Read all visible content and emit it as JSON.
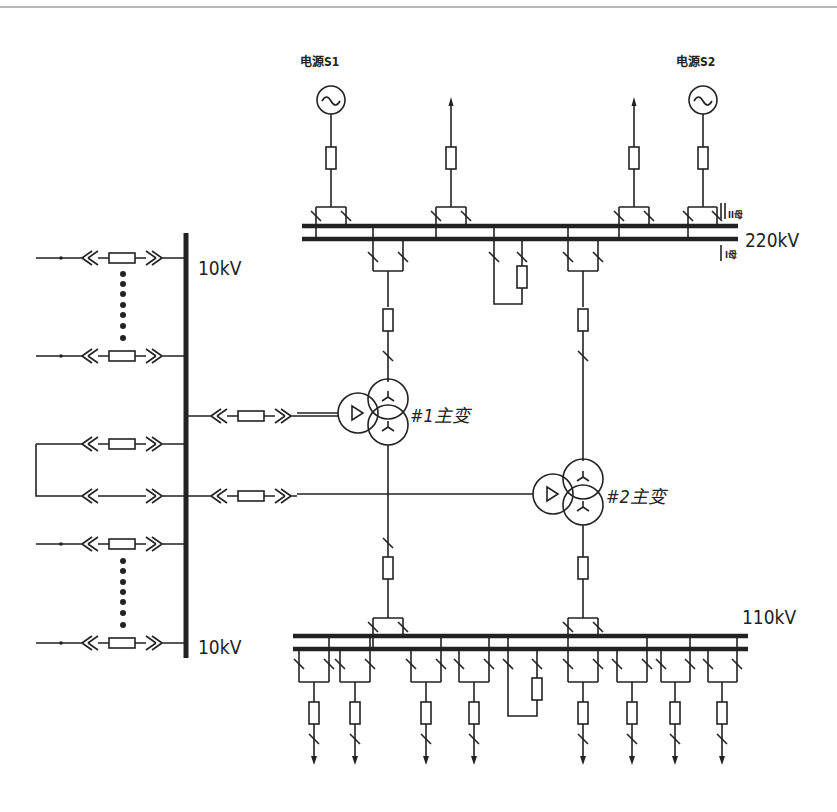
{
  "diagram": {
    "sources": [
      {
        "id": "S1",
        "label": "电源S1"
      },
      {
        "id": "S2",
        "label": "电源S2"
      }
    ],
    "buses": {
      "hv": {
        "voltage": "220kV",
        "bus_ii_label": "II母",
        "bus_i_label": "I母"
      },
      "mv": {
        "voltage": "110kV"
      },
      "lv_top": {
        "voltage": "10kV"
      },
      "lv_bottom": {
        "voltage": "10kV"
      }
    },
    "transformers": [
      {
        "id": "T1",
        "label": "#1主变"
      },
      {
        "id": "T2",
        "label": "#2主变"
      }
    ],
    "hv_bays": [
      "Source S1 incoming",
      "Outgoing line 1",
      "Outgoing line 2",
      "Source S2 incoming",
      "#1 transformer HV",
      "Bus tie",
      "#2 transformer HV"
    ],
    "mv_feeders_count": 8,
    "lv_feeders": [
      "Feeder (top)",
      "Feeder (ellipsis)",
      "Feeder",
      "#1 transformer LV",
      "Bus link",
      "#2 transformer LV",
      "Feeder",
      "Feeder (ellipsis)",
      "Feeder (bottom)"
    ],
    "colors": {
      "line": "#222222",
      "background": "#ffffff"
    }
  }
}
